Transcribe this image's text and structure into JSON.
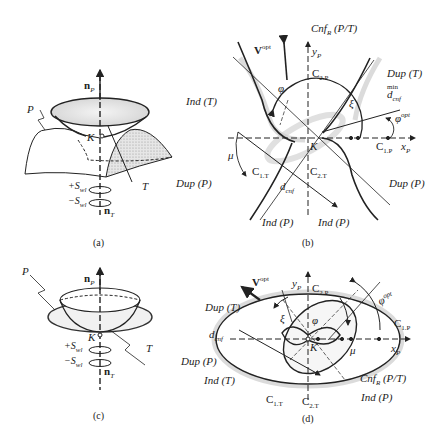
{
  "figure": {
    "panels": [
      {
        "id": "a",
        "caption": "(a)",
        "labels": {
          "np": "n",
          "np_sub": "P",
          "P": "P",
          "K": "K",
          "T": "T",
          "plus_swl": "+S",
          "minus_swl": "−S",
          "swl_sub": "wl",
          "nt": "n",
          "nt_sub": "T"
        }
      },
      {
        "id": "b",
        "caption": "(b)",
        "labels": {
          "cnf": "Cnf",
          "cnf_sub": "R",
          "cnf_rest": " (P/T)",
          "vopt": "V",
          "vopt_sup": "opt",
          "yp": "y",
          "yp_sub": "P",
          "c2p": "C",
          "c2p_sub": "2.P",
          "dup_t": "Dup (T)",
          "dmin": "d",
          "dmin_sub": "cnf",
          "dmin_sup": "min",
          "phiopt": "φ",
          "phiopt_sup": "opt",
          "phi": "φ",
          "xi": "ξ",
          "ind_t": "Ind (T)",
          "mu": "μ",
          "K": "K",
          "c1p": "C",
          "c1p_sub": "1.P",
          "xp": "x",
          "xp_sub": "P",
          "c1t": "C",
          "c1t_sub": "1.T",
          "c2t": "C",
          "c2t_sub": "2.T",
          "dcnf": "d",
          "dcnf_sub": "cnf",
          "dup_p_left": "Dup (P)",
          "dup_p_right": "Dup (P)",
          "ind_p_left": "Ind (P)",
          "ind_p_right": "Ind (P)"
        }
      },
      {
        "id": "c",
        "caption": "(c)",
        "labels": {
          "np": "n",
          "np_sub": "P",
          "P": "P",
          "K": "K",
          "T": "T",
          "plus_swl": "+S",
          "minus_swl": "−S",
          "swl_sub": "wl",
          "nt": "n",
          "nt_sub": "T"
        }
      },
      {
        "id": "d",
        "caption": "(d)",
        "labels": {
          "vopt": "V",
          "vopt_sup": "opt",
          "yp": "y",
          "yp_sub": "P",
          "c2p": "C",
          "c2p_sub": "2.P",
          "phiopt": "φ",
          "phiopt_sup": "opt",
          "c1p": "C",
          "c1p_sub": "1.P",
          "dup_t": "Dup (T)",
          "dcnf": "d",
          "dcnf_sub": "cnf",
          "dup_p": "Dup (P)",
          "ind_t": "Ind (T)",
          "xi": "ξ",
          "phi": "φ",
          "mu": "μ",
          "K": "K",
          "xp": "x",
          "xp_sub": "P",
          "c1t": "C",
          "c1t_sub": "1.T",
          "c2t": "C",
          "c2t_sub": "2.T",
          "cnf": "Cnf",
          "cnf_sub": "R",
          "cnf_rest": " (P/T)",
          "ind_p": "Ind (P)"
        }
      }
    ]
  }
}
